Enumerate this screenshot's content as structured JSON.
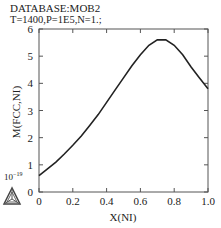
{
  "header": {
    "database": "DATABASE:MOB2",
    "conditions": "T=1400,P=1E5,N=1.;"
  },
  "logo": {
    "icon": "thermo-calc-triangle-logo"
  },
  "chart_data": {
    "type": "line",
    "title": "DATABASE:MOB2",
    "subtitle": "T=1400,P=1E5,N=1.;",
    "xlabel": "X(NI)",
    "ylabel": "M(FCC,NI)",
    "y_scale_annotation": "10^-19",
    "xlim": [
      0,
      1.0
    ],
    "ylim": [
      0,
      6
    ],
    "x_ticks": [
      "0",
      "0.2",
      "0.4",
      "0.6",
      "0.8",
      "1.0"
    ],
    "y_ticks": [
      "0",
      "1",
      "2",
      "3",
      "4",
      "5",
      "6"
    ],
    "grid": false,
    "series": [
      {
        "name": "M(FCC,NI)",
        "x": [
          0.0,
          0.05,
          0.1,
          0.15,
          0.2,
          0.25,
          0.3,
          0.35,
          0.4,
          0.45,
          0.5,
          0.55,
          0.6,
          0.65,
          0.7,
          0.75,
          0.8,
          0.85,
          0.9,
          0.95,
          1.0
        ],
        "values": [
          0.6,
          0.85,
          1.1,
          1.4,
          1.72,
          2.06,
          2.45,
          2.85,
          3.3,
          3.75,
          4.2,
          4.65,
          5.05,
          5.4,
          5.6,
          5.6,
          5.4,
          5.05,
          4.6,
          4.2,
          3.8
        ]
      }
    ]
  }
}
